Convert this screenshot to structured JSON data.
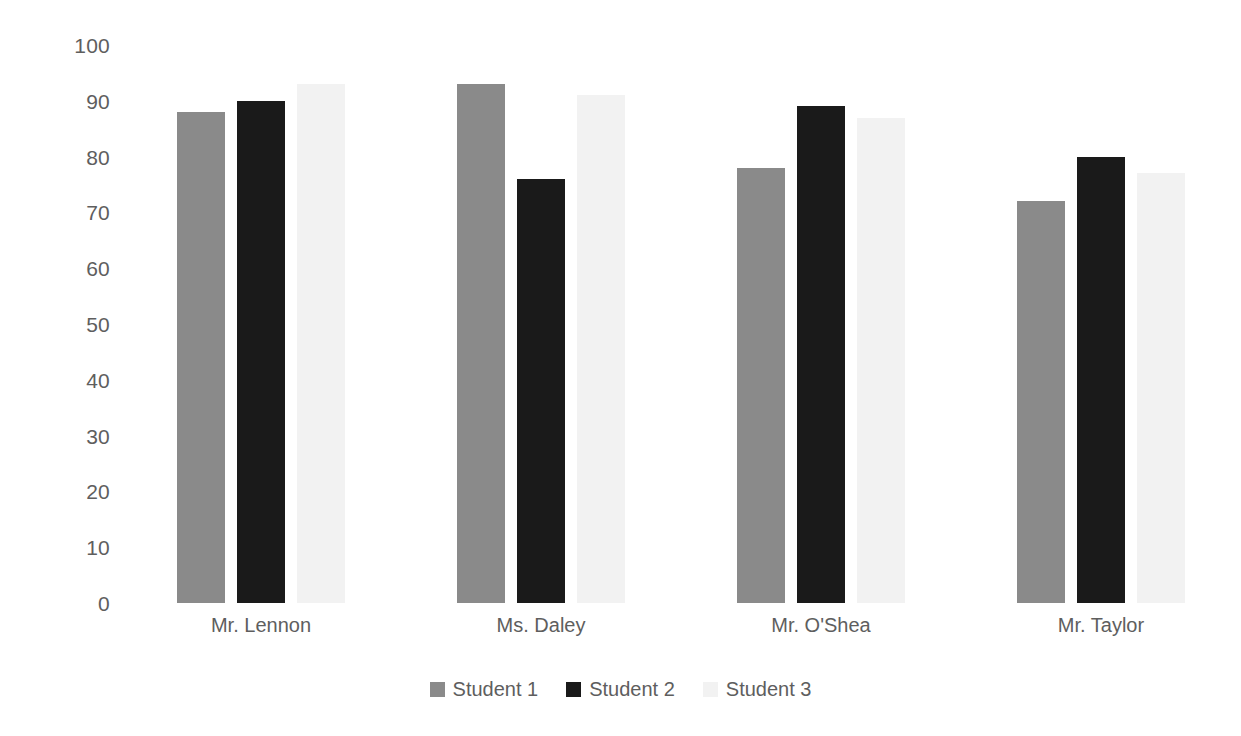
{
  "chart_data": {
    "type": "bar",
    "title": "",
    "subtitle": "",
    "xlabel": "",
    "ylabel": "",
    "categories": [
      "Mr. Lennon",
      "Ms. Daley",
      "Mr. O'Shea",
      "Mr. Taylor"
    ],
    "series": [
      {
        "name": "Student 1",
        "values": [
          88,
          93,
          78,
          72
        ],
        "color": "#8a8a8a"
      },
      {
        "name": "Student 2",
        "values": [
          90,
          76,
          89,
          80
        ],
        "color": "#1a1a1a"
      },
      {
        "name": "Student 3",
        "values": [
          93,
          91,
          87,
          77
        ],
        "color": "#f2f2f2"
      }
    ],
    "ylim": [
      0,
      100
    ],
    "ytick_labels": [
      "100",
      "90",
      "80",
      "70",
      "60",
      "50",
      "40",
      "30",
      "20",
      "10",
      "0"
    ],
    "ytick_values": [
      100,
      90,
      80,
      70,
      60,
      50,
      40,
      30,
      20,
      10,
      0
    ],
    "grid": false,
    "axis_lines": false,
    "legend_position": "bottom",
    "background_color": "#ffffff",
    "tick_label_color": "#5e5e5e",
    "bar_group_mode": "grouped"
  },
  "legend": {
    "entries": [
      {
        "label": "Student 1"
      },
      {
        "label": "Student 2"
      },
      {
        "label": "Student 3"
      }
    ]
  }
}
